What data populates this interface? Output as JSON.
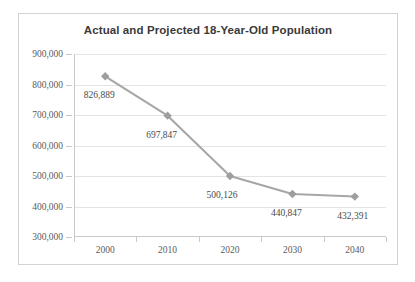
{
  "chart_data": {
    "type": "line",
    "title": "Actual and Projected 18-Year-Old Population",
    "xlabel": "",
    "ylabel": "",
    "categories": [
      "2000",
      "2010",
      "2020",
      "2030",
      "2040"
    ],
    "values": [
      826889,
      697847,
      500126,
      440847,
      432391
    ],
    "point_labels": [
      "826,889",
      "697,847",
      "500,126",
      "440,847",
      "432,391"
    ],
    "ylim": [
      300000,
      900000
    ],
    "ytick_step": 100000,
    "ytick_labels": [
      "300,000",
      "400,000",
      "500,000",
      "600,000",
      "700,000",
      "800,000",
      "900,000"
    ],
    "grid": "horizontal",
    "legend": "none",
    "series": [
      {
        "name": "18-Year-Old Population",
        "values": [
          826889,
          697847,
          500126,
          440847,
          432391
        ],
        "line_color": "#a6a6a6",
        "marker": "diamond",
        "marker_color": "#a6a6a6"
      }
    ],
    "colors": {
      "line": "#a6a6a6",
      "marker": "#9e9e9e",
      "gridline": "#e4e4e4",
      "axis": "#c9c9c9",
      "border": "#d3d3d3",
      "title_text": "#3a3a3a",
      "tick_text": "#5b5b5b",
      "label_text": "#4a4a4a",
      "background": "#ffffff"
    }
  }
}
